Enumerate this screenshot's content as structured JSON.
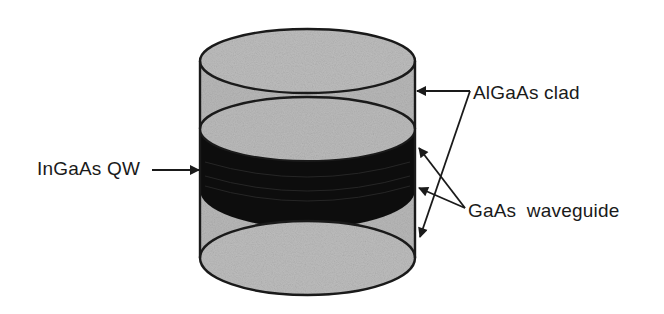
{
  "diagram": {
    "type": "layered-cylinder-schematic",
    "labels": {
      "quantum_well": "InGaAs QW",
      "cladding": "AlGaAs clad",
      "waveguide": "GaAs waveguide"
    },
    "layers": [
      {
        "name": "AlGaAs clad (top)",
        "shade": "light-gray"
      },
      {
        "name": "GaAs waveguide",
        "shade": "black"
      },
      {
        "name": "InGaAs QW",
        "shade": "black"
      },
      {
        "name": "GaAs waveguide",
        "shade": "black"
      },
      {
        "name": "AlGaAs clad (bottom)",
        "shade": "light-gray"
      }
    ],
    "colors": {
      "clad_fill": "#b8b8b8",
      "core_fill": "#101010",
      "outline": "#1a1a1a",
      "background": "#ffffff"
    }
  }
}
